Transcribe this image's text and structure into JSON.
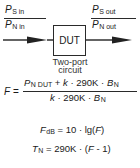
{
  "diagram": {
    "input": {
      "numerator": {
        "symbol": "P",
        "subscript": "S in"
      },
      "denominator": {
        "symbol": "P",
        "subscript": "N in"
      }
    },
    "output": {
      "numerator": {
        "symbol": "P",
        "subscript": "S out"
      },
      "denominator": {
        "symbol": "P",
        "subscript": "N out"
      }
    },
    "block": {
      "label": "DUT"
    },
    "caption": {
      "line1": "Two-port",
      "line2": "circuit"
    }
  },
  "equations": {
    "noise_factor": {
      "lhs": "F",
      "equals": "=",
      "numerator": {
        "p_symbol": "P",
        "p_subscript": "N DUT",
        "rest": " + ",
        "k": "k",
        "mid": " · 290K · ",
        "b_symbol": "B",
        "b_subscript": "N"
      },
      "denominator": {
        "k": "k",
        "mid": " · 290K · ",
        "b_symbol": "B",
        "b_subscript": "N"
      }
    },
    "noise_figure": {
      "lhs_symbol": "F",
      "lhs_subscript": "dB",
      "rhs_prefix": " = 10 · lg(",
      "rhs_var": "F",
      "rhs_suffix": ")"
    },
    "noise_temperature": {
      "lhs_symbol": "T",
      "lhs_subscript": "N",
      "rhs_prefix": " = 290K · (",
      "rhs_var": "F",
      "rhs_suffix": " - 1)"
    }
  }
}
